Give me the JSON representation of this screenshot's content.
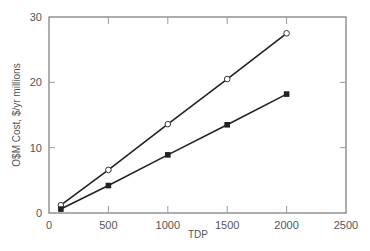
{
  "chart_data": {
    "type": "line",
    "title": "",
    "xlabel": "TDP",
    "ylabel": "O$M Cost, $/yr millions",
    "xlim": [
      0,
      2500
    ],
    "ylim": [
      0,
      30
    ],
    "xticks": [
      0,
      500,
      1000,
      1500,
      2000,
      2500
    ],
    "yticks": [
      0,
      10,
      20,
      30
    ],
    "grid": false,
    "legend": "none",
    "x": [
      100,
      500,
      1000,
      1500,
      2000
    ],
    "series": [
      {
        "name": "open-circle series",
        "marker": "open-circle",
        "values": [
          1.2,
          6.6,
          13.6,
          20.5,
          27.5
        ]
      },
      {
        "name": "filled-square series",
        "marker": "filled-square",
        "values": [
          0.6,
          4.2,
          8.9,
          13.5,
          18.2
        ]
      }
    ]
  }
}
